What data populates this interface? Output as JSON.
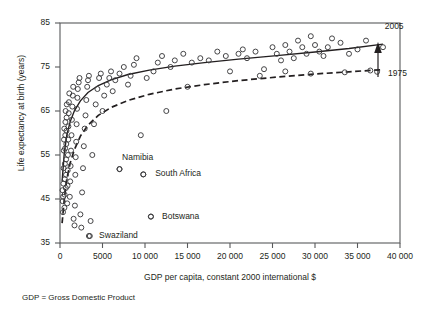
{
  "chart_data": {
    "type": "scatter",
    "title": "",
    "xlabel": "GDP per capita, constant 2000 international $",
    "ylabel": "Life expectancy at birth (years)",
    "xlim": [
      0,
      40000
    ],
    "ylim": [
      35,
      85
    ],
    "grid": false,
    "legend_position": "inline-annotation",
    "xticks": [
      {
        "value": 0,
        "label": "0"
      },
      {
        "value": 5000,
        "label": "5000"
      },
      {
        "value": 10000,
        "label": "10 000"
      },
      {
        "value": 15000,
        "label": "15 000"
      },
      {
        "value": 20000,
        "label": "20 000"
      },
      {
        "value": 25000,
        "label": "25 000"
      },
      {
        "value": 30000,
        "label": "30 000"
      },
      {
        "value": 35000,
        "label": "35 000"
      },
      {
        "value": 40000,
        "label": "40 000"
      }
    ],
    "yticks": [
      {
        "value": 35,
        "label": "35"
      },
      {
        "value": 45,
        "label": "45"
      },
      {
        "value": 55,
        "label": "55"
      },
      {
        "value": 65,
        "label": "65"
      },
      {
        "value": 75,
        "label": "75"
      },
      {
        "value": 85,
        "label": "85"
      }
    ],
    "annotations": [
      {
        "name": "curve-label-2005",
        "text": "2005",
        "x": 38200,
        "y": 84.2
      },
      {
        "name": "curve-label-1975",
        "text": "1975",
        "x": 38600,
        "y": 73.3
      },
      {
        "name": "arrow-1975-to-2005",
        "text": "",
        "x": 38000,
        "y": 78.0
      }
    ],
    "point_labels": [
      {
        "name": "namibia",
        "text": "Namibia",
        "x": 7300,
        "y": 54.4,
        "px": 7000,
        "py": 51.8
      },
      {
        "name": "south-africa",
        "text": "South Africa",
        "x": 11200,
        "y": 50.7,
        "px": 9800,
        "py": 50.6
      },
      {
        "name": "botswana",
        "text": "Botswana",
        "x": 12000,
        "y": 41.0,
        "px": 10700,
        "py": 41.0
      },
      {
        "name": "swaziland",
        "text": "Swaziland",
        "x": 4600,
        "y": 36.6,
        "px": 3400,
        "py": 36.6
      }
    ],
    "footnote": "GDP = Gross Domestic Product",
    "series": [
      {
        "name": "2005 fitted curve",
        "type": "line",
        "style": "solid",
        "points": [
          [
            250,
            49.0
          ],
          [
            500,
            55.5
          ],
          [
            800,
            59.5
          ],
          [
            1200,
            62.6
          ],
          [
            1700,
            65.1
          ],
          [
            2400,
            67.3
          ],
          [
            3300,
            69.2
          ],
          [
            4500,
            70.8
          ],
          [
            6000,
            72.1
          ],
          [
            8000,
            73.3
          ],
          [
            10500,
            74.3
          ],
          [
            13500,
            75.2
          ],
          [
            17000,
            76.0
          ],
          [
            21000,
            76.8
          ],
          [
            25500,
            77.6
          ],
          [
            30000,
            78.4
          ],
          [
            34000,
            79.2
          ],
          [
            38000,
            80.2
          ]
        ]
      },
      {
        "name": "1975 fitted curve",
        "type": "line",
        "style": "dashed",
        "points": [
          [
            250,
            39.5
          ],
          [
            500,
            45.0
          ],
          [
            800,
            49.5
          ],
          [
            1200,
            53.2
          ],
          [
            1700,
            56.3
          ],
          [
            2400,
            59.3
          ],
          [
            3300,
            61.8
          ],
          [
            4500,
            64.0
          ],
          [
            6000,
            65.8
          ],
          [
            8000,
            67.4
          ],
          [
            10500,
            68.8
          ],
          [
            13500,
            70.0
          ],
          [
            17000,
            71.0
          ],
          [
            21000,
            71.9
          ],
          [
            25500,
            72.7
          ],
          [
            30000,
            73.4
          ],
          [
            34000,
            73.9
          ],
          [
            38000,
            74.4
          ]
        ]
      },
      {
        "name": "Countries 2005",
        "type": "scatter",
        "marker": "open-circle",
        "points": [
          [
            300,
            47.0
          ],
          [
            320,
            44.5
          ],
          [
            350,
            42.0
          ],
          [
            380,
            45.5
          ],
          [
            400,
            48.5
          ],
          [
            420,
            52.0
          ],
          [
            450,
            56.0
          ],
          [
            470,
            58.5
          ],
          [
            500,
            61.0
          ],
          [
            520,
            43.0
          ],
          [
            540,
            46.0
          ],
          [
            560,
            49.5
          ],
          [
            580,
            53.0
          ],
          [
            600,
            56.5
          ],
          [
            620,
            59.5
          ],
          [
            640,
            62.5
          ],
          [
            660,
            65.0
          ],
          [
            680,
            47.5
          ],
          [
            700,
            50.5
          ],
          [
            720,
            54.0
          ],
          [
            740,
            57.5
          ],
          [
            760,
            60.5
          ],
          [
            780,
            63.5
          ],
          [
            800,
            66.5
          ],
          [
            850,
            44.0
          ],
          [
            880,
            48.0
          ],
          [
            900,
            51.5
          ],
          [
            930,
            55.0
          ],
          [
            960,
            58.5
          ],
          [
            990,
            61.5
          ],
          [
            1020,
            64.5
          ],
          [
            1050,
            67.0
          ],
          [
            1100,
            69.0
          ],
          [
            1150,
            45.5
          ],
          [
            1200,
            49.0
          ],
          [
            1250,
            52.5
          ],
          [
            1300,
            56.0
          ],
          [
            1350,
            59.5
          ],
          [
            1400,
            63.0
          ],
          [
            1450,
            66.0
          ],
          [
            1500,
            68.5
          ],
          [
            1550,
            70.5
          ],
          [
            1600,
            40.5
          ],
          [
            1700,
            39.0
          ],
          [
            1750,
            43.5
          ],
          [
            1800,
            50.5
          ],
          [
            1850,
            54.5
          ],
          [
            1900,
            58.0
          ],
          [
            1950,
            62.0
          ],
          [
            2000,
            65.5
          ],
          [
            2050,
            68.0
          ],
          [
            2100,
            70.0
          ],
          [
            2200,
            71.5
          ],
          [
            2300,
            72.5
          ],
          [
            2400,
            41.5
          ],
          [
            2500,
            38.5
          ],
          [
            2600,
            46.5
          ],
          [
            2700,
            52.0
          ],
          [
            2800,
            57.0
          ],
          [
            2900,
            61.0
          ],
          [
            3000,
            64.0
          ],
          [
            3100,
            67.5
          ],
          [
            3200,
            70.5
          ],
          [
            3300,
            72.0
          ],
          [
            3400,
            73.0
          ],
          [
            3500,
            36.6
          ],
          [
            3600,
            40.0
          ],
          [
            3800,
            55.0
          ],
          [
            4000,
            62.0
          ],
          [
            4200,
            66.5
          ],
          [
            4400,
            70.0
          ],
          [
            4600,
            72.5
          ],
          [
            4800,
            73.5
          ],
          [
            5000,
            65.0
          ],
          [
            5200,
            68.5
          ],
          [
            5500,
            71.0
          ],
          [
            5800,
            72.5
          ],
          [
            6000,
            74.0
          ],
          [
            6200,
            69.5
          ],
          [
            6500,
            72.0
          ],
          [
            7000,
            51.8
          ],
          [
            7000,
            73.5
          ],
          [
            7500,
            75.0
          ],
          [
            8000,
            71.0
          ],
          [
            8300,
            73.0
          ],
          [
            8700,
            75.5
          ],
          [
            9000,
            77.0
          ],
          [
            9500,
            59.5
          ],
          [
            9800,
            50.6
          ],
          [
            10200,
            72.5
          ],
          [
            10700,
            41.0
          ],
          [
            11000,
            74.0
          ],
          [
            11500,
            76.0
          ],
          [
            12000,
            77.5
          ],
          [
            12500,
            65.0
          ],
          [
            13000,
            75.0
          ],
          [
            13500,
            76.5
          ],
          [
            14500,
            78.0
          ],
          [
            15000,
            70.5
          ],
          [
            15500,
            76.0
          ],
          [
            16500,
            77.0
          ],
          [
            17500,
            76.5
          ],
          [
            18500,
            78.5
          ],
          [
            19500,
            77.5
          ],
          [
            20000,
            74.0
          ],
          [
            21000,
            78.0
          ],
          [
            21500,
            79.0
          ],
          [
            22000,
            77.0
          ],
          [
            23000,
            78.5
          ],
          [
            24000,
            74.5
          ],
          [
            25000,
            79.5
          ],
          [
            25500,
            78.0
          ],
          [
            26000,
            76.5
          ],
          [
            26500,
            80.0
          ],
          [
            27000,
            78.5
          ],
          [
            27500,
            77.0
          ],
          [
            28000,
            81.0
          ],
          [
            28500,
            79.5
          ],
          [
            29000,
            78.0
          ],
          [
            29500,
            82.0
          ],
          [
            30000,
            80.0
          ],
          [
            30500,
            78.5
          ],
          [
            31000,
            77.5
          ],
          [
            31500,
            79.5
          ],
          [
            32000,
            81.5
          ],
          [
            33000,
            80.5
          ],
          [
            34000,
            78.0
          ],
          [
            35000,
            79.0
          ],
          [
            36000,
            81.0
          ],
          [
            38000,
            79.5
          ]
        ]
      },
      {
        "name": "Countries 1975 (right tail)",
        "type": "scatter",
        "marker": "open-circle",
        "points": [
          [
            23500,
            73.0
          ],
          [
            26500,
            74.0
          ],
          [
            29500,
            73.5
          ],
          [
            33500,
            73.8
          ],
          [
            36500,
            74.2
          ],
          [
            37300,
            73.9
          ]
        ]
      }
    ]
  }
}
